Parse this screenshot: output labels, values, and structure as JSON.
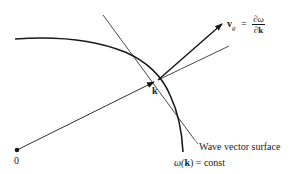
{
  "figure": {
    "colors": {
      "ink": "#1a1a1a",
      "background": "#ffffff"
    },
    "labels": {
      "origin": "0",
      "k_point": "k",
      "vg_symbol": "v",
      "vg_subscript": "g",
      "equals": "=",
      "vg_numerator": "∂ω",
      "vg_denominator": "∂k",
      "wave_vector_surface": "Wave vector surface",
      "omega_const_omega": "ω(",
      "omega_const_k": "k",
      "omega_const_rest": ") = const"
    },
    "geometry": {
      "origin": [
        17,
        150
      ],
      "k": [
        158,
        80
      ],
      "vg_tip": [
        222,
        24
      ],
      "radius_extension_end": [
        229,
        46
      ],
      "tangent_start": [
        103,
        15
      ],
      "tangent_end": [
        194,
        139
      ]
    }
  }
}
